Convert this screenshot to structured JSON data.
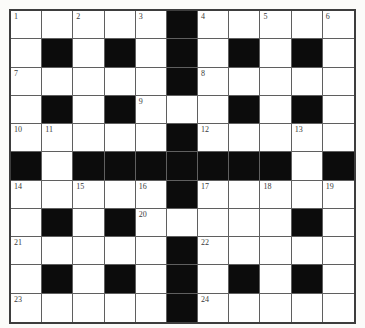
{
  "puzzle": {
    "type": "crossword-grid",
    "rows": 11,
    "cols": 11,
    "cells": [
      [
        "1",
        "",
        "2",
        "",
        "3",
        "#",
        "4",
        "",
        "5",
        "",
        "6"
      ],
      [
        "",
        "#",
        "",
        "#",
        "",
        "#",
        "",
        "#",
        "",
        "#",
        ""
      ],
      [
        "7",
        "",
        "",
        "",
        "",
        "#",
        "8",
        "",
        "",
        "",
        ""
      ],
      [
        "",
        "#",
        "",
        "#",
        "9",
        "",
        "",
        "#",
        "",
        "#",
        ""
      ],
      [
        "10",
        "11",
        "",
        "",
        "",
        "#",
        "12",
        "",
        "",
        "13",
        ""
      ],
      [
        "#",
        "",
        "#",
        "#",
        "#",
        "#",
        "#",
        "#",
        "#",
        "",
        "#"
      ],
      [
        "14",
        "",
        "15",
        "",
        "16",
        "#",
        "17",
        "",
        "18",
        "",
        "19"
      ],
      [
        "",
        "#",
        "",
        "#",
        "20",
        "",
        "",
        "",
        "",
        "#",
        ""
      ],
      [
        "21",
        "",
        "",
        "",
        "",
        "#",
        "22",
        "",
        "",
        "",
        ""
      ],
      [
        "",
        "#",
        "",
        "#",
        "",
        "#",
        "",
        "#",
        "",
        "#",
        ""
      ],
      [
        "23",
        "",
        "",
        "",
        "",
        "#",
        "24",
        "",
        "",
        "",
        ""
      ]
    ],
    "clue_numbers": [
      "1",
      "2",
      "3",
      "4",
      "5",
      "6",
      "7",
      "8",
      "9",
      "10",
      "11",
      "12",
      "13",
      "14",
      "15",
      "16",
      "17",
      "18",
      "19",
      "20",
      "21",
      "22",
      "23",
      "24"
    ]
  },
  "colors": {
    "background": "#fbfbf9",
    "cell_white": "#ffffff",
    "cell_black": "#0c0c0c",
    "grid_line": "#5f5f5f",
    "outer_border": "#3d3d3d",
    "number_text": "#3a3a3a"
  }
}
